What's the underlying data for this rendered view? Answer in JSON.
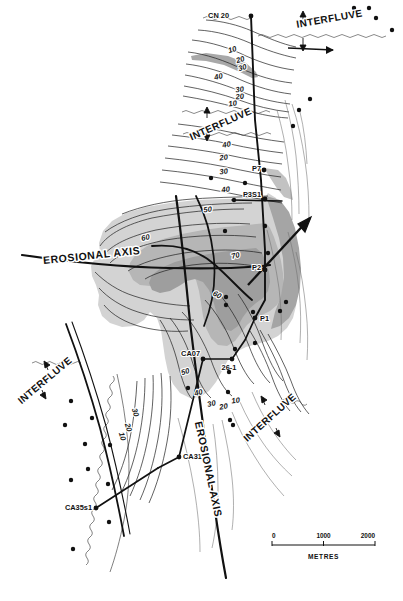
{
  "figure": {
    "type": "geological-contour-map",
    "title": "",
    "background_color": "#ffffff"
  },
  "palette": {
    "shade_light": "#d2d2d2",
    "shade_mid": "#b4b4b4",
    "shade_dark": "#9b9b9b",
    "line": "#1a1a1a",
    "thin_line": "#5a5a5a",
    "dotted_line": "#8a8a8a"
  },
  "wells": [
    {
      "id": "w1",
      "label": "CN 20",
      "x": 251,
      "y": 16,
      "label_x": 229,
      "label_y": 18,
      "anchor": "end"
    },
    {
      "id": "w2",
      "label": "P7",
      "x": 264,
      "y": 170,
      "label_x": 261,
      "label_y": 171,
      "anchor": "end"
    },
    {
      "id": "w3",
      "label": "P3S1",
      "x": 265,
      "y": 199,
      "label_x": 261,
      "label_y": 197,
      "anchor": "end"
    },
    {
      "id": "w4",
      "label": "P2",
      "x": 265,
      "y": 270,
      "label_x": 261,
      "label_y": 270,
      "anchor": "end"
    },
    {
      "id": "w5",
      "label": "P1",
      "x": 255,
      "y": 318,
      "label_x": 260,
      "label_y": 321,
      "anchor": "start"
    },
    {
      "id": "w6",
      "label": "CA07",
      "x": 203,
      "y": 359,
      "label_x": 200,
      "label_y": 356,
      "anchor": "end"
    },
    {
      "id": "w7",
      "label": "26-1",
      "x": 232,
      "y": 359,
      "label_x": 229,
      "label_y": 370,
      "anchor": "middle"
    },
    {
      "id": "w8",
      "label": "CA31",
      "x": 179,
      "y": 457,
      "label_x": 183,
      "label_y": 459,
      "anchor": "start"
    },
    {
      "id": "w9",
      "label": "CA35s1",
      "x": 96,
      "y": 508,
      "label_x": 92,
      "label_y": 510,
      "anchor": "end"
    }
  ],
  "annotations": {
    "interfluve_label": "INTERFLUVE",
    "erosional_axis_label": "EROSIONAL  AXIS",
    "interfluve_positions": [
      {
        "id": "if-top-right",
        "x": 330,
        "y": 22,
        "rotate": -10
      },
      {
        "id": "if-upper-mid",
        "x": 222,
        "y": 127,
        "rotate": -24
      },
      {
        "id": "if-left-lower",
        "x": 47,
        "y": 383,
        "rotate": -40
      },
      {
        "id": "if-right-lower",
        "x": 272,
        "y": 420,
        "rotate": -42
      }
    ],
    "erosional_axis_positions": [
      {
        "id": "ea-main",
        "x": 92,
        "y": 259,
        "rotate": -6
      },
      {
        "id": "ea-lower",
        "x": 205,
        "y": 470,
        "rotate": 78
      }
    ]
  },
  "contours": {
    "interval_label_values": [
      10,
      20,
      30,
      40,
      50,
      60,
      70
    ],
    "labels": [
      {
        "value": "10",
        "x": 233,
        "y": 52,
        "rotate": -18
      },
      {
        "value": "20",
        "x": 241,
        "y": 62,
        "rotate": -18
      },
      {
        "value": "30",
        "x": 243,
        "y": 70,
        "rotate": -16
      },
      {
        "value": "40",
        "x": 219,
        "y": 79,
        "rotate": -12
      },
      {
        "value": "30",
        "x": 240,
        "y": 92,
        "rotate": -8
      },
      {
        "value": "20",
        "x": 240,
        "y": 99,
        "rotate": -6
      },
      {
        "value": "10",
        "x": 233,
        "y": 106,
        "rotate": -8
      },
      {
        "value": "40",
        "x": 227,
        "y": 147,
        "rotate": -10
      },
      {
        "value": "20",
        "x": 224,
        "y": 160,
        "rotate": -8
      },
      {
        "value": "30",
        "x": 224,
        "y": 174,
        "rotate": -8
      },
      {
        "value": "40",
        "x": 226,
        "y": 192,
        "rotate": -8
      },
      {
        "value": "50",
        "x": 208,
        "y": 212,
        "rotate": -8
      },
      {
        "value": "60",
        "x": 146,
        "y": 240,
        "rotate": -12
      },
      {
        "value": "70",
        "x": 236,
        "y": 258,
        "rotate": -14
      },
      {
        "value": "60",
        "x": 216,
        "y": 297,
        "rotate": 28
      },
      {
        "value": "50",
        "x": 186,
        "y": 374,
        "rotate": -18
      },
      {
        "value": "40",
        "x": 199,
        "y": 395,
        "rotate": -14
      },
      {
        "value": "30",
        "x": 212,
        "y": 406,
        "rotate": -12
      },
      {
        "value": "20",
        "x": 224,
        "y": 409,
        "rotate": -10
      },
      {
        "value": "10",
        "x": 236,
        "y": 403,
        "rotate": -8
      },
      {
        "value": "30",
        "x": 133,
        "y": 413,
        "rotate": 74
      },
      {
        "value": "20",
        "x": 126,
        "y": 428,
        "rotate": 74
      },
      {
        "value": "10",
        "x": 120,
        "y": 437,
        "rotate": 74
      }
    ]
  },
  "scale_bar": {
    "ticks": [
      "0",
      "1000",
      "2000"
    ],
    "unit_label": "METRES",
    "x": 272,
    "y": 545,
    "width": 103
  },
  "data_points": {
    "note": "solid circular well/control markers",
    "coords": [
      [
        354,
        8
      ],
      [
        369,
        8
      ],
      [
        376,
        18
      ],
      [
        392,
        30
      ],
      [
        310,
        99
      ],
      [
        299,
        110
      ],
      [
        293,
        126
      ],
      [
        211,
        178
      ],
      [
        245,
        183
      ],
      [
        234,
        200
      ],
      [
        265,
        226
      ],
      [
        225,
        231
      ],
      [
        268,
        253
      ],
      [
        226,
        297
      ],
      [
        286,
        302
      ],
      [
        280,
        311
      ],
      [
        226,
        305
      ],
      [
        255,
        343
      ],
      [
        235,
        349
      ],
      [
        229,
        372
      ],
      [
        188,
        388
      ],
      [
        228,
        392
      ],
      [
        230,
        420
      ],
      [
        233,
        425
      ],
      [
        71,
        401
      ],
      [
        65,
        425
      ],
      [
        92,
        418
      ],
      [
        85,
        444
      ],
      [
        110,
        445
      ],
      [
        88,
        469
      ],
      [
        71,
        480
      ],
      [
        108,
        484
      ],
      [
        109,
        522
      ],
      [
        73,
        549
      ],
      [
        253,
        312
      ]
    ]
  },
  "caption": {
    "text": ""
  }
}
